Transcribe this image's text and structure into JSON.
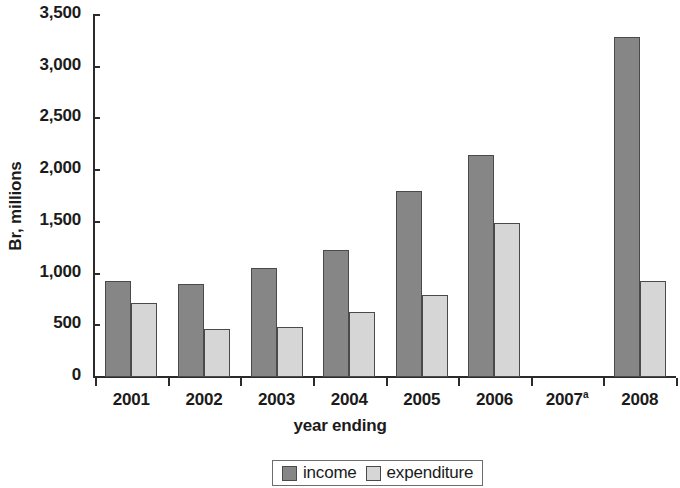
{
  "chart_data": {
    "type": "bar",
    "title": "",
    "xlabel": "year ending",
    "ylabel": "Br, millions",
    "categories": [
      "2001",
      "2002",
      "2003",
      "2004",
      "2005",
      "2006",
      "2007",
      "2008"
    ],
    "category_labels": [
      {
        "text": "2001",
        "superscript": ""
      },
      {
        "text": "2002",
        "superscript": ""
      },
      {
        "text": "2003",
        "superscript": ""
      },
      {
        "text": "2004",
        "superscript": ""
      },
      {
        "text": "2005",
        "superscript": ""
      },
      {
        "text": "2006",
        "superscript": ""
      },
      {
        "text": "2007",
        "superscript": "a"
      },
      {
        "text": "2008",
        "superscript": ""
      }
    ],
    "series": [
      {
        "name": "income",
        "color": "#868686",
        "values": [
          930,
          900,
          1050,
          1225,
          1795,
          2145,
          null,
          3290
        ]
      },
      {
        "name": "expenditure",
        "color": "#d6d6d6",
        "values": [
          720,
          465,
          480,
          625,
          795,
          1490,
          null,
          930
        ]
      }
    ],
    "ylim": [
      0,
      3500
    ],
    "yticks": [
      0,
      500,
      1000,
      1500,
      2000,
      2500,
      3000,
      3500
    ],
    "ytick_labels": [
      "0",
      "500",
      "1,000",
      "1,500",
      "2,000",
      "2,500",
      "3,000",
      "3,500"
    ],
    "grid": false,
    "legend_position": "bottom-center"
  },
  "legend": {
    "entries": [
      {
        "label": "income",
        "color": "#868686"
      },
      {
        "label": "expenditure",
        "color": "#d6d6d6"
      }
    ]
  },
  "colors": {
    "income": "#868686",
    "expenditure": "#d6d6d6",
    "axis": "#2b2b2b",
    "text": "#1b1b1b",
    "bar_outline": "#4a4a4a",
    "background": "#ffffff"
  }
}
